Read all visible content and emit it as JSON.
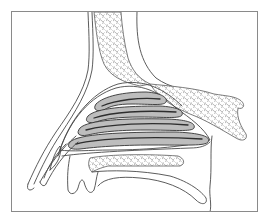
{
  "figure": {
    "type": "anatomical-line-illustration",
    "frame_color": "#8a8a8a",
    "line_color": "#4a4a4a",
    "mucosa_fill": "#bdbdbd",
    "background": "#ffffff",
    "regions": [
      {
        "name": "frontal-bone",
        "texture": "cancellous"
      },
      {
        "name": "sphenoid-body",
        "texture": "cancellous"
      },
      {
        "name": "nasal-turbinates",
        "count": 4
      },
      {
        "name": "hard-palate",
        "texture": "cancellous"
      },
      {
        "name": "soft-palate"
      },
      {
        "name": "nasal-vestibule"
      },
      {
        "name": "upper-lip"
      }
    ]
  }
}
